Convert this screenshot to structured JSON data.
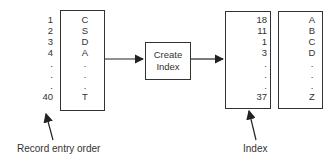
{
  "diagram": {
    "record_numbers": [
      "1",
      "2",
      "3",
      "4",
      ".",
      ".",
      ".",
      "40"
    ],
    "data_keys": [
      "C",
      "S",
      "D",
      "A",
      ".",
      ".",
      ".",
      "T"
    ],
    "process_label_line1": "Create",
    "process_label_line2": "Index",
    "index_pointers": [
      "18",
      "11",
      "1",
      "3",
      ".",
      ".",
      ".",
      "37"
    ],
    "index_keys": [
      "A",
      "B",
      "C",
      "D",
      ".",
      ".",
      ".",
      "Z"
    ],
    "label_record_order": "Record entry order",
    "label_index": "Index"
  }
}
